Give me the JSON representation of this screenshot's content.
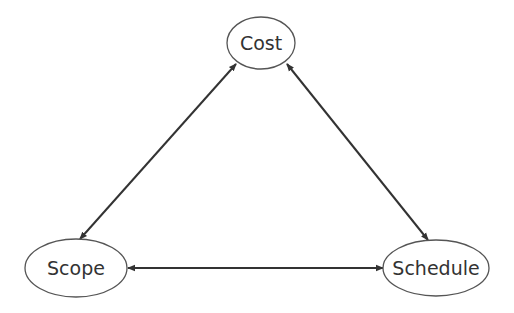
{
  "diagram": {
    "type": "triangle-relationship",
    "nodes": [
      {
        "id": "cost",
        "label": "Cost",
        "cx": 261,
        "cy": 43,
        "rx": 34,
        "ry": 26
      },
      {
        "id": "scope",
        "label": "Scope",
        "cx": 76,
        "cy": 268,
        "rx": 51,
        "ry": 29
      },
      {
        "id": "schedule",
        "label": "Schedule",
        "cx": 436,
        "cy": 268,
        "rx": 53,
        "ry": 28
      }
    ],
    "edges": [
      {
        "from": "cost",
        "to": "scope",
        "direction": "bidirectional",
        "x1": 236,
        "y1": 64,
        "x2": 80,
        "y2": 239
      },
      {
        "from": "cost",
        "to": "schedule",
        "direction": "bidirectional",
        "x1": 287,
        "y1": 64,
        "x2": 428,
        "y2": 240
      },
      {
        "from": "scope",
        "to": "schedule",
        "direction": "bidirectional",
        "x1": 128,
        "y1": 268,
        "x2": 383,
        "y2": 268
      }
    ],
    "colors": {
      "stroke": "#555555",
      "edge": "#333333",
      "text": "#333333",
      "background": "#ffffff"
    }
  }
}
